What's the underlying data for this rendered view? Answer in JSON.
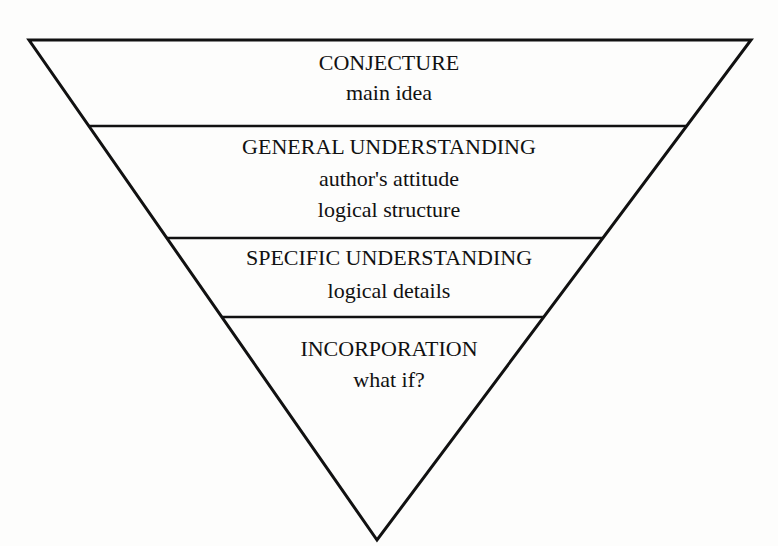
{
  "diagram": {
    "type": "inverted-pyramid",
    "levels": [
      {
        "title": "CONJECTURE",
        "lines": [
          "main idea"
        ]
      },
      {
        "title": "GENERAL UNDERSTANDING",
        "lines": [
          "author's attitude",
          "logical structure"
        ]
      },
      {
        "title": "SPECIFIC UNDERSTANDING",
        "lines": [
          "logical details"
        ]
      },
      {
        "title": "INCORPORATION",
        "lines": [
          "what if?"
        ]
      }
    ],
    "colors": {
      "stroke": "#111111",
      "background": "#fdfdfc",
      "text": "#111111"
    }
  }
}
